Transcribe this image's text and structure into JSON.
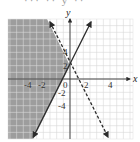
{
  "header": {
    "cutoff_text": "··· ·· y ··"
  },
  "chart_data": {
    "type": "line",
    "title": "",
    "xlabel": "x",
    "ylabel": "y",
    "xlim": [
      -9,
      9.5
    ],
    "ylim": [
      -9,
      9
    ],
    "grid": true,
    "x_ticks": [
      -4,
      -2,
      0,
      2,
      4
    ],
    "y_ticks": [
      4,
      2,
      -2,
      -4
    ],
    "tick_labels": {
      "x": [
        "-4",
        "-2",
        "0",
        "2",
        "4"
      ],
      "y": [
        "4",
        "2",
        "-2",
        "-4"
      ]
    },
    "series": [
      {
        "name": "boundary-solid",
        "equation": "y = 2x + 2",
        "style": "solid",
        "points": [
          [
            -1,
            0
          ],
          [
            0,
            2
          ]
        ]
      },
      {
        "name": "boundary-dashed",
        "equation": "y = -2x + 2",
        "style": "dashed",
        "points": [
          [
            0,
            2
          ],
          [
            1,
            0
          ]
        ]
      }
    ],
    "shaded_region": {
      "description": "y >= 2x + 2 and y < -2x + 2",
      "color": "#8c8c8c",
      "test_point": [
        -4,
        0
      ]
    },
    "intersection": [
      0,
      2
    ],
    "colors": {
      "shade": "#8c8c8c",
      "grid": "#d9d9d9",
      "line": "#2b2b2b"
    }
  }
}
